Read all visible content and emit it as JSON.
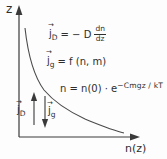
{
  "diagram": {
    "axes": {
      "y_label": "z",
      "x_label": "n(z)"
    },
    "notation": {
      "vector_arrow": "→"
    },
    "equations": {
      "diffusion_flux": {
        "symbol": "j",
        "sub": "D",
        "mid": "= − D",
        "frac_num": "dn",
        "frac_den": "dz"
      },
      "gravitational_flux": {
        "symbol": "j",
        "sub": "g",
        "rest": "= f (n, m)"
      },
      "barometric": {
        "base": "n = n(0) · e",
        "exponent": "−Cmgz / kT"
      }
    },
    "flux_arrows": {
      "up_label": {
        "symbol": "j",
        "sub": "D"
      },
      "down_label": {
        "symbol": "j",
        "sub": "g"
      }
    },
    "colors": {
      "ink": "#3a3a3a",
      "background": "#fdfdfd"
    }
  }
}
